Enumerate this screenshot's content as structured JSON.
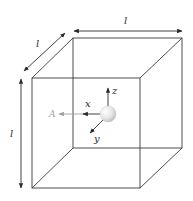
{
  "diagram": {
    "type": "cube-with-particle",
    "dimension_labels": {
      "width": "l",
      "depth": "l",
      "height": "l"
    },
    "axes": {
      "x": "x",
      "y": "y",
      "z": "z"
    },
    "vector_label": "A",
    "colors": {
      "edge": "#3a3a3a",
      "vector": "#a0a0a0",
      "sphere_light": "#ffffff",
      "sphere_dark": "#b8b8b8"
    }
  }
}
